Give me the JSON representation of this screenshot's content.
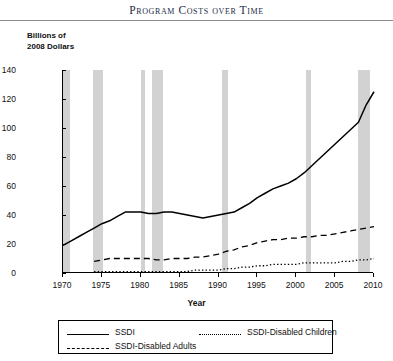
{
  "title": "Program Costs over Time",
  "y_axis_caption": "Billions of\n2008 Dollars",
  "x_axis_label": "Year",
  "legend": {
    "items": [
      {
        "label": "SSDI",
        "style": "solid"
      },
      {
        "label": "SSDI-Disabled Children",
        "style": "dotted"
      },
      {
        "label": "SSDI-Disabled Adults",
        "style": "dashed"
      }
    ]
  },
  "chart_data": {
    "type": "line",
    "title": "Program Costs over Time",
    "xlabel": "Year",
    "ylabel": "Billions of 2008 Dollars",
    "xlim": [
      1970,
      2010
    ],
    "ylim": [
      0,
      140
    ],
    "xticks": [
      1970,
      1975,
      1980,
      1985,
      1990,
      1995,
      2000,
      2005,
      2010
    ],
    "yticks": [
      0,
      20,
      40,
      60,
      80,
      100,
      120,
      140
    ],
    "grid": false,
    "legend_position": "below-plot",
    "x": [
      1970,
      1971,
      1972,
      1973,
      1974,
      1975,
      1976,
      1977,
      1978,
      1979,
      1980,
      1981,
      1982,
      1983,
      1984,
      1985,
      1986,
      1987,
      1988,
      1989,
      1990,
      1991,
      1992,
      1993,
      1994,
      1995,
      1996,
      1997,
      1998,
      1999,
      2000,
      2001,
      2002,
      2003,
      2004,
      2005,
      2006,
      2007,
      2008,
      2009,
      2010
    ],
    "series": [
      {
        "name": "SSDI",
        "style": "solid",
        "values": [
          19,
          22,
          25,
          28,
          31,
          34,
          36,
          39,
          42,
          42,
          42,
          41,
          41,
          42,
          42,
          41,
          40,
          39,
          38,
          39,
          40,
          41,
          42,
          45,
          48,
          52,
          55,
          58,
          60,
          62,
          65,
          69,
          74,
          79,
          84,
          89,
          94,
          99,
          104,
          116,
          125
        ]
      },
      {
        "name": "SSDI-Disabled Adults",
        "style": "dashed",
        "values": [
          null,
          null,
          null,
          null,
          8,
          9,
          10,
          10,
          10,
          10,
          10,
          10,
          9,
          9,
          10,
          10,
          10,
          11,
          11,
          12,
          13,
          15,
          16,
          18,
          19,
          21,
          22,
          23,
          23,
          24,
          24,
          25,
          25,
          26,
          26,
          27,
          28,
          29,
          30,
          31,
          32
        ]
      },
      {
        "name": "SSDI-Disabled Children",
        "style": "dotted",
        "values": [
          null,
          null,
          null,
          null,
          1,
          1,
          1,
          1,
          1,
          1,
          1,
          1,
          1,
          1,
          1,
          1,
          1,
          2,
          2,
          2,
          2,
          3,
          3,
          4,
          4,
          5,
          5,
          6,
          6,
          6,
          6,
          7,
          7,
          7,
          7,
          7,
          8,
          8,
          9,
          9,
          10
        ]
      }
    ],
    "recession_bands": [
      {
        "start": 1969.9,
        "end": 1970.9
      },
      {
        "start": 1973.9,
        "end": 1975.2
      },
      {
        "start": 1980.0,
        "end": 1980.6
      },
      {
        "start": 1981.5,
        "end": 1982.9
      },
      {
        "start": 1990.5,
        "end": 1991.2
      },
      {
        "start": 2001.2,
        "end": 2001.9
      },
      {
        "start": 2007.9,
        "end": 2009.5
      }
    ],
    "band_color": "#d2d2d2",
    "line_color": "#000000"
  }
}
